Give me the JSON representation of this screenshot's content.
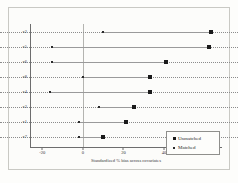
{
  "chart_data": {
    "type": "scatter",
    "title": "",
    "xlabel": "Standardized % bias across covariates",
    "ylabel": "",
    "xlim": [
      -26,
      68
    ],
    "xticks": [
      -20,
      0,
      20,
      40,
      60
    ],
    "xticklabels": [
      "-20",
      "0",
      "20",
      "40",
      "60"
    ],
    "categories": [
      "x2",
      "x5",
      "x6",
      "x8",
      "x4",
      "x3",
      "x1",
      "x7"
    ],
    "grid": "dotted-horizontal",
    "legend_position": "bottom-right",
    "series": [
      {
        "name": "Unmatched",
        "marker": "filled-square",
        "values": [
          63,
          62,
          41,
          33,
          33,
          25,
          21,
          10
        ]
      },
      {
        "name": "Matched",
        "marker": "small-dot",
        "values": [
          10,
          -15,
          -15,
          0,
          -16,
          8,
          -2,
          -2
        ]
      }
    ],
    "zero_reference_line": 0
  },
  "legend": {
    "items": [
      {
        "label": "Unmatched",
        "marker": "filled-square"
      },
      {
        "label": "Matched",
        "marker": "small-dot"
      }
    ]
  }
}
